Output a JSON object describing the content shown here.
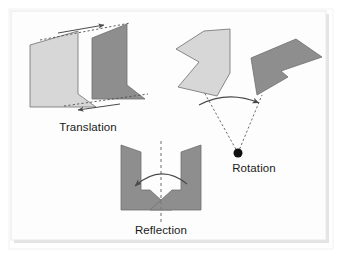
{
  "figure": {
    "background_color": "#ffffff",
    "panel_color": "#fdfdfd",
    "panel_border_color": "#e8e8e8",
    "panel_shadow_color": "#d9d9d9",
    "shape_light_fill": "#d7d7d7",
    "shape_dark_fill": "#8e8e8e",
    "shape_stroke_color": "#6e6e6e",
    "guide_line_color": "#555555",
    "arrow_color": "#4a4a4a",
    "pivot_color": "#101010",
    "label_color": "#1b1b1b"
  },
  "panels": [
    {
      "id": "translation",
      "label": "Translation",
      "label_x": 88,
      "label_y": 131,
      "description": "A chevron shape slid horizontally to the right; dashed guide lines with arrows show the direction of the slide.",
      "shapes": [
        {
          "name": "translation-shape-original",
          "fill_key": "shape_light_fill",
          "points": "30,45 78,31 78,94 96,107 30,107"
        },
        {
          "name": "translation-shape-image",
          "fill_key": "shape_dark_fill",
          "points": "92,38 127,24 127,85 145,99 92,99"
        }
      ],
      "guides": [
        {
          "name": "translation-guide-top",
          "x1": 40,
          "y1": 40,
          "x2": 130,
          "y2": 23
        },
        {
          "name": "translation-guide-bottom",
          "x1": 64,
          "y1": 106,
          "x2": 148,
          "y2": 94
        }
      ],
      "arrows": [
        {
          "name": "translation-arrow-top",
          "x1": 58,
          "y1": 33,
          "x2": 104,
          "y2": 25
        },
        {
          "name": "translation-arrow-bottom",
          "x1": 120,
          "y1": 104,
          "x2": 78,
          "y2": 110
        }
      ]
    },
    {
      "id": "rotation",
      "label": "Rotation",
      "label_x": 254,
      "label_y": 172,
      "description": "A chevron shape turned about a fixed pivot point; dashed rays run from the pivot to both copies and a curved arrow shows the turn.",
      "shapes": [
        {
          "name": "rotation-shape-original",
          "fill_key": "shape_light_fill",
          "points": "204,31 230,29 230,73 217,96 178,87 199,62 176,49"
        },
        {
          "name": "rotation-shape-image",
          "fill_key": "shape_dark_fill",
          "points": "251,58 296,39 322,57 281,71 288,77 257,95"
        }
      ],
      "pivot": {
        "name": "rotation-pivot-point",
        "cx": 238,
        "cy": 153,
        "r": 4.5
      },
      "guides": [
        {
          "name": "rotation-ray-original",
          "x1": 238,
          "y1": 153,
          "x2": 204,
          "y2": 92
        },
        {
          "name": "rotation-ray-image",
          "x1": 238,
          "y1": 153,
          "x2": 262,
          "y2": 95
        }
      ],
      "arcs": [
        {
          "name": "rotation-arc-arrow",
          "d": "M 199,105 Q 228,90 259,103"
        }
      ]
    },
    {
      "id": "reflection",
      "label": "Reflection",
      "label_x": 161,
      "label_y": 234,
      "description": "A chevron shape flipped across a vertical dashed mirror line; a curved arrow shows the flip.",
      "shapes": [
        {
          "name": "reflection-shape-original",
          "fill_key": "shape_dark_fill",
          "points": "181,152 201,145 201,210 150,210 172,190 181,190"
        },
        {
          "name": "reflection-shape-image",
          "fill_key": "shape_dark_fill",
          "points": "141,152 121,145 121,210 172,210 150,190 141,190"
        }
      ],
      "mirror_line": {
        "name": "reflection-mirror-line",
        "x1": 161,
        "y1": 141,
        "x2": 161,
        "y2": 222
      },
      "arcs": [
        {
          "name": "reflection-arc-arrow",
          "d": "M 187,184 Q 161,163 135,186"
        }
      ]
    }
  ],
  "panel_frame": {
    "x": 11,
    "y": 11,
    "width": 315,
    "height": 229
  }
}
